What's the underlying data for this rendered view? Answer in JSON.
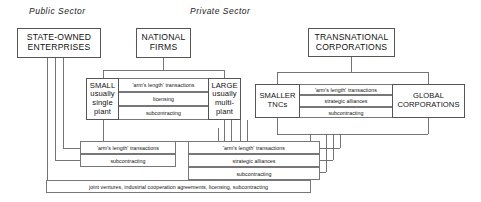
{
  "diagram": {
    "headings": {
      "public_sector": "Public Sector",
      "private_sector": "Private Sector"
    },
    "nodes": {
      "state_owned": "STATE-OWNED\nENTERPRISES",
      "national_firms": "NATIONAL\nFIRMS",
      "transnational": "TRANSNATIONAL\nCORPORATIONS",
      "small": "SMALL\nusually\nsingle\nplant",
      "large": "LARGE\nusually\nmulti-\nplant",
      "smaller_tncs": "SMALLER\nTNCs",
      "global_corps": "GLOBAL\nCORPORATIONS"
    },
    "relations": {
      "small_large": [
        "'arm's length' transactions",
        "licensing",
        "subcontracting"
      ],
      "tnc_pair": [
        "'arm's length' transactions",
        "strategic alliances",
        "subcontracting"
      ],
      "public_private_left": [
        "'arm's length' transactions",
        "subcontracting"
      ],
      "national_tnc": [
        "'arm's length' transactions",
        "strategic alliances",
        "subcontracting"
      ],
      "bottom": "joint ventures, industrial cooperation agreements, licensing, subcontracting"
    },
    "colors": {
      "background": "#ffffff",
      "box_border": "#555555",
      "link_border": "#777777",
      "connector": "#666666",
      "text": "#111111"
    }
  }
}
